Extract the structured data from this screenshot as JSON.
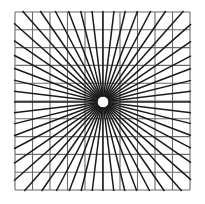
{
  "figure": {
    "title": "Radial ray burst over square grid (Hering-type optical illusion)",
    "canvas": {
      "width": 205,
      "height": 204,
      "background_color": "#ffffff"
    },
    "chart_data": {
      "type": "scatter",
      "title": "Radial ray burst over square grid (Hering-type optical illusion)",
      "subtitle": "",
      "xlabel": "",
      "ylabel": "",
      "xlim": [
        0,
        205
      ],
      "ylim": [
        0,
        204
      ],
      "grid": true,
      "legend_position": "none",
      "annotations": [],
      "tick_labels_x": [],
      "tick_labels_y": [],
      "series": [
        {
          "name": "grid",
          "kind": "grid",
          "color": "#6b6b6b",
          "line_width": 1.1,
          "x_lines": [
            15,
            32.5,
            50,
            67.5,
            85,
            102.5,
            120,
            137.5,
            155,
            172.5,
            190
          ],
          "y_lines": [
            12,
            29.8,
            47.6,
            65.4,
            83.2,
            101,
            118.8,
            136.6,
            154.4,
            172.2,
            190
          ],
          "x_extent": [
            15,
            190
          ],
          "y_extent": [
            12,
            190
          ]
        },
        {
          "name": "rays",
          "kind": "radial",
          "color": "#1a1a1a",
          "line_width": 1.5,
          "center_x": 103,
          "center_y": 102,
          "inner_radius": 5.5,
          "count": 52,
          "angles_deg": [
            0,
            6.9,
            13.8,
            20.8,
            27.7,
            34.6,
            41.5,
            48.5,
            55.4,
            62.3,
            69.2,
            76.2,
            83.1,
            90,
            96.9,
            103.8,
            110.8,
            117.7,
            124.6,
            131.5,
            138.5,
            145.4,
            152.3,
            159.2,
            166.2,
            173.1,
            180,
            186.9,
            193.8,
            200.8,
            207.7,
            214.6,
            221.5,
            228.5,
            235.4,
            242.3,
            249.2,
            256.2,
            263.1,
            270,
            276.9,
            283.8,
            290.8,
            297.7,
            304.6,
            311.5,
            318.5,
            325.4,
            332.3,
            339.2,
            346.2,
            353.1
          ],
          "outer_bounds": {
            "left": 14,
            "top": 11,
            "right": 191,
            "bottom": 191
          }
        },
        {
          "name": "center-gap",
          "kind": "disc",
          "color": "#ffffff",
          "center_x": 103,
          "center_y": 102,
          "radius": 5.0
        }
      ]
    },
    "colors": {
      "background": "#ffffff",
      "grid_line": "#6b6b6b",
      "ray_line": "#1a1a1a",
      "center_fill": "#ffffff"
    }
  }
}
